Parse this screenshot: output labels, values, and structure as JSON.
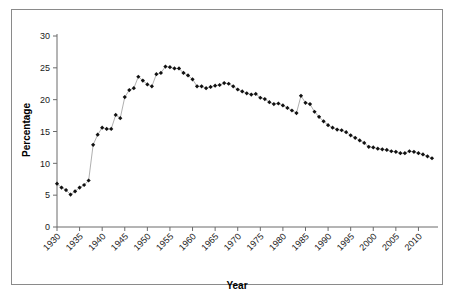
{
  "chart_data": {
    "type": "line",
    "title": "",
    "xlabel": "Year",
    "ylabel": "Percentage",
    "xlim": [
      1930,
      2013
    ],
    "ylim": [
      0,
      30
    ],
    "grid": false,
    "legend": null,
    "marker": "diamond",
    "xticks": [
      1930,
      1935,
      1940,
      1945,
      1950,
      1955,
      1960,
      1965,
      1970,
      1975,
      1980,
      1985,
      1990,
      1995,
      2000,
      2005,
      2010
    ],
    "xticklabels": [
      "1930",
      "1935",
      "1940",
      "1945",
      "1950",
      "1955",
      "1960",
      "1965",
      "1970",
      "1975",
      "1980",
      "1985",
      "1990",
      "1995",
      "2000",
      "2005",
      "2010"
    ],
    "yticks": [
      0,
      5,
      10,
      15,
      20,
      25,
      30
    ],
    "yticklabels": [
      "0",
      "5",
      "10",
      "15",
      "20",
      "25",
      "30"
    ],
    "series": [
      {
        "name": "Percentage",
        "x": [
          1930,
          1931,
          1932,
          1933,
          1934,
          1935,
          1936,
          1937,
          1938,
          1939,
          1940,
          1941,
          1942,
          1943,
          1944,
          1945,
          1946,
          1947,
          1948,
          1949,
          1950,
          1951,
          1952,
          1953,
          1954,
          1955,
          1956,
          1957,
          1958,
          1959,
          1960,
          1961,
          1962,
          1963,
          1964,
          1965,
          1966,
          1967,
          1968,
          1969,
          1970,
          1971,
          1972,
          1973,
          1974,
          1975,
          1976,
          1977,
          1978,
          1979,
          1980,
          1981,
          1982,
          1983,
          1984,
          1985,
          1986,
          1987,
          1988,
          1989,
          1990,
          1991,
          1992,
          1993,
          1994,
          1995,
          1996,
          1997,
          1998,
          1999,
          2000,
          2001,
          2002,
          2003,
          2004,
          2005,
          2006,
          2007,
          2008,
          2009,
          2010,
          2011,
          2012,
          2013
        ],
        "y": [
          6.8,
          6.2,
          5.8,
          5.1,
          5.6,
          6.2,
          6.6,
          7.3,
          12.9,
          14.5,
          15.6,
          15.4,
          15.4,
          17.6,
          17.1,
          20.4,
          21.5,
          21.8,
          23.6,
          23.0,
          22.4,
          22.1,
          24.0,
          24.2,
          25.2,
          25.1,
          24.9,
          24.9,
          24.2,
          23.8,
          23.2,
          22.1,
          22.1,
          21.8,
          22.0,
          22.2,
          22.3,
          22.6,
          22.5,
          22.1,
          21.6,
          21.3,
          21.0,
          20.8,
          20.9,
          20.3,
          20.1,
          19.6,
          19.3,
          19.4,
          19.1,
          18.7,
          18.3,
          17.9,
          20.6,
          19.5,
          19.3,
          18.1,
          17.3,
          16.6,
          16.0,
          15.6,
          15.3,
          15.2,
          14.9,
          14.4,
          14.0,
          13.6,
          13.2,
          12.6,
          12.5,
          12.3,
          12.2,
          12.1,
          11.9,
          11.8,
          11.6,
          11.6,
          11.9,
          11.8,
          11.6,
          11.4,
          11.1,
          10.8
        ]
      }
    ]
  }
}
